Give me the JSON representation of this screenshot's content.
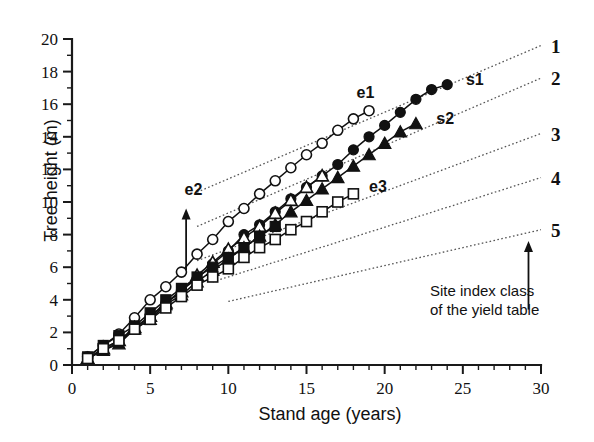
{
  "figure": {
    "title": "",
    "note": {
      "line1": "Site index class",
      "line2": "of the yield table"
    }
  },
  "chart_data": {
    "type": "line",
    "title": "",
    "xlabel": "Stand age (years)",
    "ylabel": "Tree height (m)",
    "xlim": [
      0,
      30
    ],
    "ylim": [
      0,
      20
    ],
    "x_ticks": [
      0,
      5,
      10,
      15,
      20,
      25,
      30
    ],
    "y_ticks": [
      0,
      2,
      4,
      6,
      8,
      10,
      12,
      14,
      16,
      18,
      20
    ],
    "x_minor_step": 1,
    "y_minor_step": 1,
    "grid": false,
    "legend": "none",
    "annotations": [
      {
        "text": "e1",
        "x": 18.2,
        "y": 16.4
      },
      {
        "text": "e2",
        "x": 7.2,
        "y": 10.4
      },
      {
        "text": "e3",
        "x": 19.0,
        "y": 10.6
      },
      {
        "text": "s1",
        "x": 25.2,
        "y": 17.2
      },
      {
        "text": "s2",
        "x": 23.3,
        "y": 14.8
      },
      {
        "text": "Site index class of the yield table",
        "x": 26.5,
        "y": 5.2
      }
    ],
    "arrows": [
      {
        "name": "e2-arrow",
        "x": 7.3,
        "y_from": 5.8,
        "y_to": 9.6,
        "direction": "up"
      },
      {
        "name": "site-index-arrow",
        "x": 29.2,
        "y_from": 3.4,
        "y_to": 7.6,
        "direction": "up"
      }
    ],
    "series": [
      {
        "name": "e1",
        "marker": "open-circle",
        "x": [
          1,
          2,
          3,
          4,
          5,
          6,
          7,
          8,
          9,
          10,
          11,
          12,
          13,
          14,
          15,
          16,
          17,
          18,
          19
        ],
        "values": [
          0.5,
          1.2,
          1.9,
          2.9,
          4.0,
          4.8,
          5.7,
          6.8,
          7.7,
          8.8,
          9.6,
          10.5,
          11.3,
          12.1,
          12.9,
          13.6,
          14.4,
          15.1,
          15.6
        ]
      },
      {
        "name": "s1",
        "marker": "filled-circle",
        "x": [
          1,
          2,
          3,
          4,
          5,
          6,
          7,
          8,
          9,
          10,
          11,
          12,
          13,
          14,
          15,
          16,
          17,
          18,
          19,
          20,
          21,
          22,
          23,
          24
        ],
        "values": [
          0.4,
          0.9,
          1.4,
          2.3,
          2.9,
          3.8,
          4.6,
          5.3,
          6.2,
          7.0,
          8.0,
          8.6,
          9.4,
          10.2,
          10.9,
          11.6,
          12.3,
          13.2,
          14.0,
          14.7,
          15.5,
          16.3,
          16.9,
          17.2
        ]
      },
      {
        "name": "open-triangle-series",
        "marker": "open-triangle",
        "x": [
          1,
          2,
          3,
          4,
          5,
          6,
          7,
          8,
          9,
          10,
          11,
          12,
          13,
          14,
          15,
          16
        ],
        "values": [
          0.4,
          1.0,
          1.5,
          2.3,
          3.0,
          3.8,
          4.5,
          5.5,
          6.3,
          7.1,
          7.8,
          8.5,
          9.3,
          10.1,
          10.9,
          11.6
        ]
      },
      {
        "name": "s2",
        "marker": "filled-triangle",
        "x": [
          1,
          2,
          3,
          4,
          5,
          6,
          7,
          8,
          9,
          10,
          11,
          12,
          13,
          14,
          15,
          16,
          17,
          18,
          19,
          20,
          21,
          22
        ],
        "values": [
          0.4,
          0.9,
          1.3,
          2.2,
          2.8,
          3.7,
          4.3,
          5.1,
          5.8,
          6.5,
          7.2,
          7.9,
          8.6,
          9.4,
          10.1,
          10.8,
          11.5,
          12.2,
          12.9,
          13.6,
          14.3,
          14.8
        ]
      },
      {
        "name": "filled-square-series",
        "marker": "filled-square",
        "x": [
          1,
          2,
          3,
          4,
          5,
          6,
          7,
          8,
          9,
          10,
          11,
          12,
          13
        ],
        "values": [
          0.5,
          1.2,
          1.8,
          2.4,
          3.2,
          4.0,
          4.7,
          5.4,
          6.0,
          6.6,
          7.2,
          7.9,
          8.5
        ]
      },
      {
        "name": "e3",
        "marker": "open-square",
        "x": [
          1,
          2,
          3,
          4,
          5,
          6,
          7,
          8,
          9,
          10,
          11,
          12,
          13,
          14,
          15,
          16,
          17,
          18
        ],
        "values": [
          0.4,
          1.0,
          1.5,
          2.2,
          2.8,
          3.5,
          4.2,
          4.9,
          5.4,
          5.9,
          6.6,
          7.2,
          7.7,
          8.3,
          8.8,
          9.4,
          10.0,
          10.5
        ]
      }
    ],
    "reference_lines": [
      {
        "label": "1",
        "x": [
          8.0,
          30.0
        ],
        "y": [
          10.6,
          19.6
        ]
      },
      {
        "label": "2",
        "x": [
          8.0,
          30.0
        ],
        "y": [
          8.5,
          17.6
        ]
      },
      {
        "label": "3",
        "x": [
          8.0,
          30.0
        ],
        "y": [
          6.4,
          14.2
        ]
      },
      {
        "label": "4",
        "x": [
          9.0,
          30.0
        ],
        "y": [
          5.1,
          11.5
        ]
      },
      {
        "label": "5",
        "x": [
          10.0,
          30.0
        ],
        "y": [
          3.9,
          8.3
        ]
      }
    ]
  }
}
